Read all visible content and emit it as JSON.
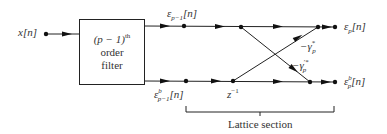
{
  "diagram": {
    "input_label": "x[n]",
    "filter_block": {
      "line1": "(p − 1)",
      "line1_sup": "th",
      "line2": "order",
      "line3": "filter"
    },
    "top_signal": {
      "base": "ε",
      "sub": "p−1",
      "suffix": "[n]"
    },
    "bottom_signal": {
      "base": "ε",
      "sup": "b",
      "sub": "p−1",
      "suffix": "[n]"
    },
    "delay_label": {
      "base": "z",
      "sup": "−1"
    },
    "coef_upper": {
      "base": "−γ",
      "sup": "*",
      "sub": "p"
    },
    "coef_lower": {
      "base": "−γ",
      "sup": "′*",
      "sub": "p"
    },
    "out_top": {
      "base": "ε",
      "sub": "p",
      "suffix": "[n]"
    },
    "out_bottom": {
      "base": "ε",
      "sup": "b",
      "sub": "p",
      "suffix": "[n]"
    },
    "bracket_label": "Lattice section"
  }
}
